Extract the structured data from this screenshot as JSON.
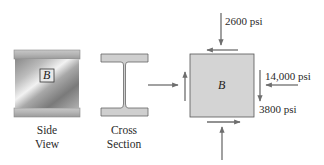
{
  "diagram": {
    "side_view": {
      "label_line1": "Side",
      "label_line2": "View",
      "element_label": "B"
    },
    "cross_section": {
      "label_line1": "Cross",
      "label_line2": "Section"
    },
    "stress_element": {
      "element_label": "B",
      "normal_stress_vertical": "2600 psi",
      "normal_stress_horizontal": "14,000 psi",
      "shear_stress": "3800 psi",
      "fill_color": "#d4d4d4",
      "arrow_color": "#6e6e6e"
    }
  }
}
